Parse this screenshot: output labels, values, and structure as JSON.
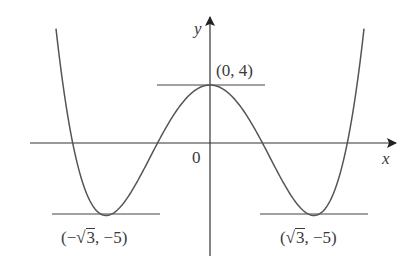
{
  "chart_data": {
    "type": "line",
    "title": "",
    "function": "y = x^4 - 6x^2 + 4",
    "xlabel": "x",
    "ylabel": "y",
    "origin_label": "0",
    "xlim": [
      -2.9,
      3.06
    ],
    "ylim": [
      -7.7,
      8.6
    ],
    "grid": false,
    "legend": null,
    "series": [
      {
        "name": "f(x)",
        "x": [
          -2.567,
          -2.4,
          -2.2,
          -2.0,
          -1.732,
          -1.5,
          -1.2,
          -0.9,
          -0.6,
          -0.3,
          0,
          0.3,
          0.6,
          0.9,
          1.2,
          1.5,
          1.732,
          2.0,
          2.2,
          2.4,
          2.567
        ],
        "values": [
          7.9,
          2.62,
          -1.62,
          -4.0,
          -5.0,
          -4.44,
          -2.57,
          0.8,
          1.97,
          3.47,
          4,
          3.47,
          1.97,
          0.8,
          -2.57,
          -4.44,
          -5.0,
          -4.0,
          -1.62,
          2.62,
          7.9
        ]
      }
    ],
    "annotations": [
      {
        "label_parts": [
          "(0, 4)"
        ],
        "x": 0,
        "y": 4,
        "type": "local maximum",
        "tangent": "horizontal"
      },
      {
        "label_parts": [
          "(−",
          "3",
          ", −5)"
        ],
        "x": -1.732,
        "y": -5,
        "type": "local minimum",
        "tangent": "horizontal"
      },
      {
        "label_parts": [
          "(",
          "3",
          ", −5)"
        ],
        "x": 1.732,
        "y": -5,
        "type": "local minimum",
        "tangent": "horizontal"
      }
    ]
  },
  "colors": {
    "curve": "#555555",
    "axes": "#333333",
    "text": "#3a3a3a"
  },
  "labels": {
    "x_axis": "x",
    "y_axis": "y",
    "origin": "0",
    "max_point": "(0, 4)",
    "left_min_prefix": "(−",
    "left_min_root": "3",
    "left_min_suffix": ", −5)",
    "right_min_prefix": "(",
    "right_min_root": "3",
    "right_min_suffix": ", −5)",
    "sqrt_symbol": "√"
  }
}
